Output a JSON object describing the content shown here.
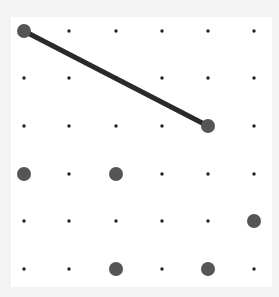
{
  "game": {
    "type": "dot-grid-connect",
    "grid": {
      "cols": 6,
      "rows": 6,
      "col_x": [
        24,
        69,
        116,
        162,
        208,
        254
      ],
      "row_y": [
        31,
        78,
        126,
        174,
        221,
        269
      ]
    },
    "colors": {
      "background": "#f3f3f3",
      "board": "#ffffff",
      "small_dot": "#222222",
      "large_dot": "#555555",
      "line": "#2a2a2a"
    },
    "selected_dots": [
      {
        "col": 0,
        "row": 0
      },
      {
        "col": 4,
        "row": 2
      },
      {
        "col": 0,
        "row": 3
      },
      {
        "col": 2,
        "row": 3
      },
      {
        "col": 5,
        "row": 4
      },
      {
        "col": 2,
        "row": 5
      },
      {
        "col": 4,
        "row": 5
      }
    ],
    "lines": [
      {
        "from": {
          "col": 0,
          "row": 0
        },
        "to": {
          "col": 4,
          "row": 2
        }
      }
    ]
  }
}
